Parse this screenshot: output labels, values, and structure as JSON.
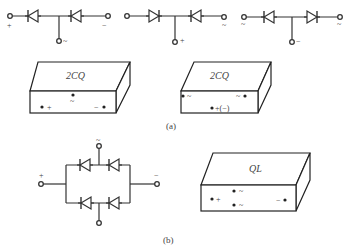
{
  "figure_a": {
    "caption": "(a)",
    "circuits": [
      {
        "name": "common-anode-cathode-1",
        "left_terminal_label": "+",
        "right_terminal_label": "−",
        "center_terminal_label": "~",
        "left_diode_direction": "left",
        "right_diode_direction": "left"
      },
      {
        "name": "common-cathode",
        "left_terminal_label": "",
        "right_terminal_label": "~",
        "center_terminal_label": "+",
        "left_diode_direction": "right",
        "right_diode_direction": "left"
      },
      {
        "name": "common-anode",
        "left_terminal_label": "~",
        "right_terminal_label": "~",
        "center_terminal_label": "−",
        "left_diode_direction": "left",
        "right_diode_direction": "right"
      }
    ],
    "packages": [
      {
        "title": "2CQ",
        "pins": [
          {
            "label": "+",
            "position": "left"
          },
          {
            "label": "~",
            "position": "center"
          },
          {
            "label": "−",
            "position": "right"
          }
        ]
      },
      {
        "title": "2CQ",
        "pins": [
          {
            "label": "~",
            "position": "left"
          },
          {
            "label": "~",
            "position": "right"
          },
          {
            "label": "+(−)",
            "position": "center"
          }
        ]
      }
    ]
  },
  "figure_b": {
    "caption": "(b)",
    "bridge": {
      "left_terminal_label": "+",
      "right_terminal_label": "−",
      "top_terminal_label": "~",
      "bottom_terminal_label": "~",
      "diode_direction": "left",
      "diode_count": 4
    },
    "package": {
      "title": "QL",
      "pins": [
        {
          "label": "+",
          "position": "left"
        },
        {
          "label": "~",
          "position": "center-top"
        },
        {
          "label": "~",
          "position": "center-bottom"
        },
        {
          "label": "−",
          "position": "right"
        }
      ]
    }
  }
}
